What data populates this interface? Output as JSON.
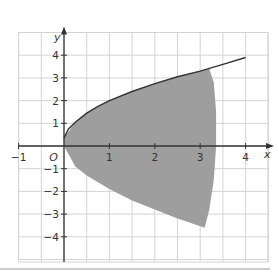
{
  "chart_data": {
    "type": "area",
    "title": "",
    "xlabel": "x",
    "ylabel": "y",
    "origin_label": "O",
    "xlim": [
      -1.5,
      4.5
    ],
    "ylim": [
      -5,
      4.6
    ],
    "x_ticks": [
      -1,
      1,
      2,
      3,
      4
    ],
    "x_tick_labels": [
      "−1",
      "1",
      "2",
      "3",
      "4"
    ],
    "y_ticks": [
      -4,
      -3,
      -2,
      -1,
      1,
      2,
      3,
      4
    ],
    "y_tick_labels": [
      "−4",
      "−3",
      "−2",
      "−1",
      "1",
      "2",
      "3",
      "4"
    ],
    "grid": true,
    "grid_x_step": 0.5,
    "grid_y_step": 1,
    "series": [
      {
        "name": "curve",
        "type": "line",
        "x": [
          0,
          0.1,
          0.25,
          0.5,
          0.75,
          1,
          1.5,
          2,
          2.5,
          3,
          3.5,
          4
        ],
        "y": [
          0.35,
          0.75,
          1.05,
          1.45,
          1.75,
          2.0,
          2.4,
          2.75,
          3.05,
          3.3,
          3.6,
          3.9
        ]
      },
      {
        "name": "shaded-region",
        "type": "area",
        "description": "Grey shaded region bounded above by the curve, on the right near x≈3.35, and below by a mirrored curve reaching about y≈−3.6 near x≈3.1",
        "upper_x": [
          0,
          0.25,
          0.5,
          1,
          1.5,
          2,
          2.5,
          3,
          3.2
        ],
        "upper_y": [
          0.35,
          1.05,
          1.45,
          2.0,
          2.4,
          2.75,
          3.05,
          3.3,
          3.4
        ],
        "right_x": [
          3.2,
          3.3,
          3.35,
          3.35,
          3.3,
          3.2,
          3.1
        ],
        "right_y": [
          3.4,
          2.8,
          1.5,
          0,
          -1.5,
          -2.8,
          -3.6
        ],
        "lower_x": [
          3.1,
          2.5,
          2,
          1.5,
          1,
          0.5,
          0.25,
          0
        ],
        "lower_y": [
          -3.6,
          -3.2,
          -2.8,
          -2.4,
          -1.9,
          -1.3,
          -0.9,
          0
        ],
        "color": "#9a9a9a"
      }
    ],
    "colors": {
      "grid": "#d4d4d4",
      "axis": "#333333",
      "curve": "#333333",
      "shade": "#9e9e9e",
      "separator": "#bdbdbd"
    }
  }
}
